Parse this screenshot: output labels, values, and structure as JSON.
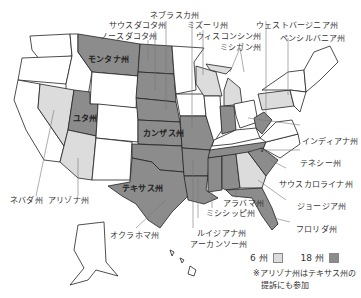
{
  "title": "",
  "colors": {
    "light": "#dcdcdc",
    "dark": "#8c8c8c",
    "none": "#ffffff",
    "border": "#222222"
  },
  "labels": {
    "nebraska": "ネブラスカ州",
    "south_dakota": "サウスダコタ州",
    "north_dakota": "ノースダコタ州",
    "missouri": "ミズーリ州",
    "wisconsin": "ウィスコンシン州",
    "michigan": "ミシガン州",
    "west_virginia": "ウェストバージニア州",
    "pennsylvania": "ペンシルバニア州",
    "montana": "モンタナ州",
    "utah": "ユタ州",
    "kansas": "カンザス州",
    "indiana": "インディアナ州",
    "tennessee": "テネシー州",
    "south_carolina": "サウスカロライナ州",
    "georgia": "ジョージア州",
    "florida": "フロリダ州",
    "texas": "テキサス州",
    "nevada": "ネバダ州",
    "arizona": "アリゾナ州",
    "oklahoma": "オクラホマ州",
    "alabama": "アラバマ州",
    "mississippi": "ミシシッピ州",
    "louisiana": "ルイジアナ州",
    "arkansas": "アーカンソー州"
  },
  "legend": {
    "light_label": "6 州",
    "dark_label": "18 州"
  },
  "note": {
    "line1": "※アリゾナ州はテキサス州の",
    "line2": "提訴にも参加"
  }
}
